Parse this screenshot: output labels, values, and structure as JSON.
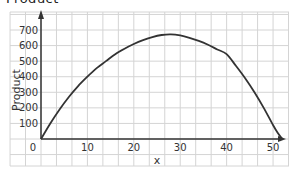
{
  "page": {
    "cropped_title": "Product"
  },
  "chart_data": {
    "type": "line",
    "title": "",
    "xlabel": "x",
    "ylabel": "Product",
    "xlim": [
      0,
      52
    ],
    "ylim": [
      0,
      700
    ],
    "x_ticks": [
      "0",
      "10",
      "20",
      "30",
      "40",
      "50"
    ],
    "y_ticks": [
      "100",
      "200",
      "300",
      "400",
      "500",
      "600",
      "700"
    ],
    "grid": true,
    "legend": null,
    "series": [
      {
        "name": "Product",
        "color": "#333333",
        "x": [
          0,
          2,
          4,
          6,
          8,
          10,
          12,
          14,
          16,
          18,
          20,
          22,
          24,
          26,
          28,
          30,
          32,
          34,
          36,
          38,
          40,
          42,
          44,
          46,
          48,
          50,
          51,
          52
        ],
        "y": [
          0,
          100,
          190,
          270,
          340,
          400,
          455,
          500,
          545,
          580,
          610,
          635,
          655,
          668,
          672,
          665,
          650,
          630,
          605,
          575,
          545,
          470,
          390,
          300,
          200,
          90,
          40,
          0
        ]
      }
    ]
  },
  "colors": {
    "grid": "#d4d4d4",
    "axis": "#333333",
    "curve": "#3a3a3a"
  }
}
